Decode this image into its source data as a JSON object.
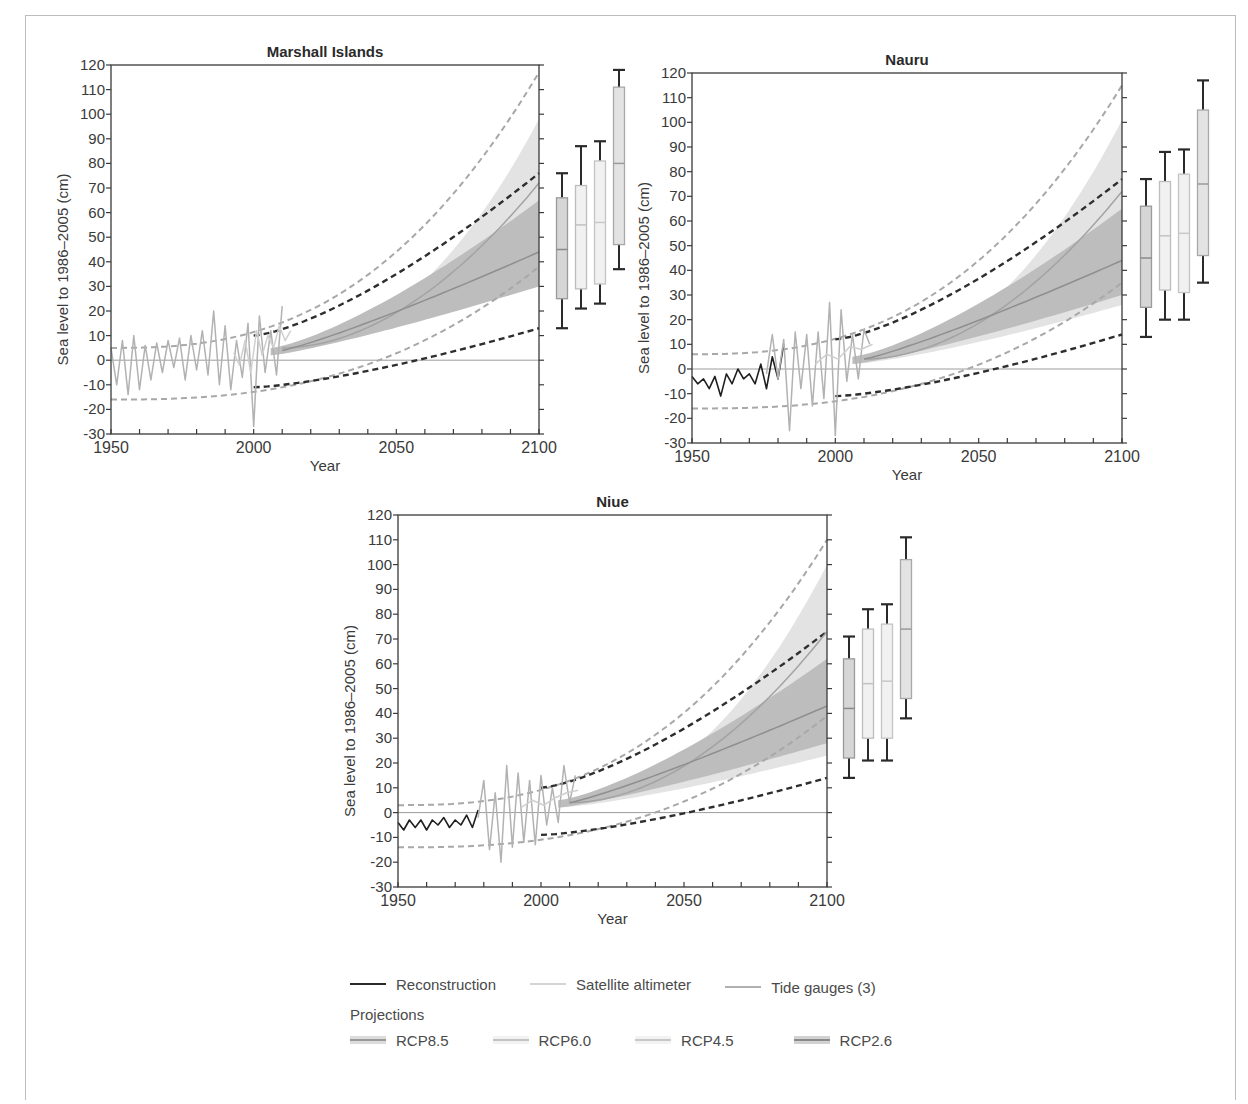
{
  "figure": {
    "frame": true
  },
  "axes_common": {
    "ylabel": "Sea level to 1986–2005 (cm)",
    "xlabel": "Year",
    "yticks": [
      120,
      110,
      100,
      90,
      80,
      70,
      60,
      50,
      40,
      30,
      20,
      10,
      0,
      -10,
      -20,
      -30
    ],
    "xticks": [
      1950,
      2000,
      2050,
      2100
    ],
    "ylim": [
      -30,
      120
    ],
    "xlim": [
      1950,
      2100
    ]
  },
  "legend": {
    "observations": [
      {
        "label": "Reconstruction",
        "color": "#2a2a2a"
      },
      {
        "label": "Satellite altimeter",
        "color": "#d4d4d4"
      },
      {
        "label": "Tide gauges (3)",
        "color": "#b0b0b0"
      }
    ],
    "projections_title": "Projections",
    "projections": [
      {
        "label": "RCP8.5",
        "band": "#d9d9d9",
        "line": "#9a9a9a"
      },
      {
        "label": "RCP6.0",
        "band": "#ececec",
        "line": "#c4c4c4"
      },
      {
        "label": "RCP4.5",
        "band": "#eeeeee",
        "line": "#c8c8c8"
      },
      {
        "label": "RCP2.6",
        "band": "#cfcfcf",
        "line": "#8a8a8a"
      }
    ]
  },
  "chart_data": [
    {
      "type": "line",
      "title": "Marshall Islands",
      "xlabel": "Year",
      "ylabel": "Sea level to 1986–2005 (cm)",
      "xlim": [
        1950,
        2100
      ],
      "ylim": [
        -30,
        120
      ],
      "grid": false,
      "series": [
        {
          "name": "Tide gauges (3)",
          "x": [
            1950,
            1952,
            1954,
            1956,
            1958,
            1960,
            1962,
            1964,
            1966,
            1968,
            1970,
            1972,
            1974,
            1976,
            1978,
            1980,
            1982,
            1984,
            1986,
            1988,
            1990,
            1992,
            1994,
            1996,
            1998,
            2000,
            2002,
            2004,
            2006,
            2008,
            2010
          ],
          "values": [
            5,
            -10,
            8,
            -14,
            10,
            -12,
            6,
            -8,
            7,
            -5,
            8,
            -3,
            9,
            -8,
            10,
            -4,
            12,
            -6,
            20,
            -10,
            14,
            -12,
            8,
            -7,
            15,
            -27,
            18,
            -5,
            12,
            -6,
            22
          ]
        },
        {
          "name": "Satellite altimeter",
          "x": [
            1993,
            1995,
            1997,
            1999,
            2001,
            2003,
            2005,
            2007,
            2009,
            2011,
            2013
          ],
          "values": [
            3,
            -2,
            8,
            -5,
            12,
            2,
            10,
            5,
            14,
            8,
            12
          ]
        },
        {
          "name": "RCP8.5 median",
          "x": [
            2010,
            2100
          ],
          "values": [
            5,
            72
          ]
        },
        {
          "name": "RCP2.6 median",
          "x": [
            2010,
            2100
          ],
          "values": [
            4,
            44
          ]
        }
      ],
      "envelopes": {
        "rcp85_band": {
          "x_end": 2100,
          "upper": 98,
          "lower": 36
        },
        "rcp26_band": {
          "x_end": 2100,
          "upper": 65,
          "lower": 30
        },
        "upper_grey_dashed": {
          "start": [
            1950,
            5
          ],
          "end": [
            2100,
            117
          ]
        },
        "lower_grey_dashed": {
          "start": [
            1950,
            -16
          ],
          "end": [
            2100,
            38
          ]
        },
        "upper_black_dashed": {
          "start": [
            2000,
            10
          ],
          "end": [
            2100,
            76
          ]
        },
        "lower_black_dashed": {
          "start": [
            2000,
            -11
          ],
          "end": [
            2100,
            13
          ]
        }
      },
      "boxplots_2100": [
        {
          "scenario": "RCP2.6",
          "min": 13,
          "q1": 25,
          "median": 45,
          "q3": 66,
          "max": 76
        },
        {
          "scenario": "RCP4.5",
          "min": 21,
          "q1": 29,
          "median": 55,
          "q3": 71,
          "max": 87
        },
        {
          "scenario": "RCP6.0",
          "min": 23,
          "q1": 31,
          "median": 56,
          "q3": 81,
          "max": 89
        },
        {
          "scenario": "RCP8.5",
          "min": 37,
          "q1": 47,
          "median": 80,
          "q3": 111,
          "max": 118
        }
      ]
    },
    {
      "type": "line",
      "title": "Nauru",
      "xlabel": "Year",
      "ylabel": "Sea level to 1986–2005 (cm)",
      "xlim": [
        1950,
        2100
      ],
      "ylim": [
        -30,
        120
      ],
      "grid": false,
      "series": [
        {
          "name": "Reconstruction",
          "x": [
            1950,
            1952,
            1954,
            1956,
            1958,
            1960,
            1962,
            1964,
            1966,
            1968,
            1970,
            1972,
            1974,
            1976,
            1978,
            1980,
            1982
          ],
          "values": [
            -3,
            -6,
            -4,
            -8,
            -3,
            -11,
            -2,
            -6,
            0,
            -4,
            -2,
            -6,
            2,
            -8,
            5,
            -4,
            10
          ]
        },
        {
          "name": "Tide gauges (3)",
          "x": [
            1976,
            1978,
            1980,
            1982,
            1984,
            1986,
            1988,
            1990,
            1992,
            1994,
            1996,
            1998,
            2000,
            2002,
            2004,
            2006,
            2008,
            2010,
            2012
          ],
          "values": [
            -2,
            14,
            -4,
            12,
            -25,
            15,
            -8,
            14,
            -15,
            15,
            -12,
            27,
            -27,
            24,
            -5,
            14,
            -4,
            16,
            10
          ]
        },
        {
          "name": "Satellite altimeter",
          "x": [
            1993,
            1997,
            2001,
            2005,
            2009,
            2013
          ],
          "values": [
            2,
            6,
            4,
            9,
            8,
            10
          ]
        },
        {
          "name": "RCP8.5 median",
          "x": [
            2010,
            2100
          ],
          "values": [
            4,
            72
          ]
        },
        {
          "name": "RCP2.6 median",
          "x": [
            2010,
            2100
          ],
          "values": [
            4,
            44
          ]
        }
      ],
      "envelopes": {
        "rcp85_band": {
          "x_end": 2100,
          "upper": 101,
          "lower": 26
        },
        "rcp26_band": {
          "x_end": 2100,
          "upper": 65,
          "lower": 30
        },
        "upper_grey_dashed": {
          "start": [
            1950,
            6
          ],
          "end": [
            2100,
            115
          ]
        },
        "lower_grey_dashed": {
          "start": [
            1950,
            -16
          ],
          "end": [
            2100,
            35
          ]
        },
        "upper_black_dashed": {
          "start": [
            2000,
            12
          ],
          "end": [
            2100,
            77
          ]
        },
        "lower_black_dashed": {
          "start": [
            2000,
            -11
          ],
          "end": [
            2100,
            14
          ]
        }
      },
      "boxplots_2100": [
        {
          "scenario": "RCP2.6",
          "min": 13,
          "q1": 25,
          "median": 45,
          "q3": 66,
          "max": 77
        },
        {
          "scenario": "RCP4.5",
          "min": 20,
          "q1": 32,
          "median": 54,
          "q3": 76,
          "max": 88
        },
        {
          "scenario": "RCP6.0",
          "min": 20,
          "q1": 31,
          "median": 55,
          "q3": 79,
          "max": 89
        },
        {
          "scenario": "RCP8.5",
          "min": 35,
          "q1": 46,
          "median": 75,
          "q3": 105,
          "max": 117
        }
      ]
    },
    {
      "type": "line",
      "title": "Niue",
      "xlabel": "Year",
      "ylabel": "Sea level to 1986–2005 (cm)",
      "xlim": [
        1950,
        2100
      ],
      "ylim": [
        -30,
        120
      ],
      "grid": false,
      "series": [
        {
          "name": "Reconstruction",
          "x": [
            1950,
            1952,
            1954,
            1956,
            1958,
            1960,
            1962,
            1964,
            1966,
            1968,
            1970,
            1972,
            1974,
            1976,
            1978
          ],
          "values": [
            -4,
            -7,
            -3,
            -6,
            -3,
            -7,
            -3,
            -5,
            -2,
            -6,
            -3,
            -5,
            -1,
            -6,
            1
          ]
        },
        {
          "name": "Tide gauges (3)",
          "x": [
            1978,
            1980,
            1982,
            1984,
            1986,
            1988,
            1990,
            1992,
            1994,
            1996,
            1998,
            2000,
            2002,
            2004,
            2006,
            2008,
            2010,
            2012
          ],
          "values": [
            -2,
            13,
            -15,
            8,
            -20,
            19,
            -14,
            16,
            -12,
            13,
            -13,
            15,
            -5,
            10,
            -4,
            19,
            4,
            15
          ]
        },
        {
          "name": "Satellite altimeter",
          "x": [
            1993,
            1997,
            2001,
            2005,
            2009,
            2013
          ],
          "values": [
            2,
            5,
            3,
            6,
            8,
            9
          ]
        },
        {
          "name": "RCP8.5 median",
          "x": [
            2010,
            2100
          ],
          "values": [
            4,
            73
          ]
        },
        {
          "name": "RCP2.6 median",
          "x": [
            2010,
            2100
          ],
          "values": [
            4,
            43
          ]
        }
      ],
      "envelopes": {
        "rcp85_band": {
          "x_end": 2100,
          "upper": 100,
          "lower": 23
        },
        "rcp26_band": {
          "x_end": 2100,
          "upper": 62,
          "lower": 28
        },
        "upper_grey_dashed": {
          "start": [
            1950,
            3
          ],
          "end": [
            2100,
            110
          ]
        },
        "lower_grey_dashed": {
          "start": [
            1950,
            -14
          ],
          "end": [
            2100,
            39
          ]
        },
        "upper_black_dashed": {
          "start": [
            2000,
            10
          ],
          "end": [
            2100,
            73
          ]
        },
        "lower_black_dashed": {
          "start": [
            2000,
            -9
          ],
          "end": [
            2100,
            14
          ]
        }
      },
      "boxplots_2100": [
        {
          "scenario": "RCP2.6",
          "min": 14,
          "q1": 22,
          "median": 42,
          "q3": 62,
          "max": 71
        },
        {
          "scenario": "RCP4.5",
          "min": 21,
          "q1": 30,
          "median": 52,
          "q3": 74,
          "max": 82
        },
        {
          "scenario": "RCP6.0",
          "min": 21,
          "q1": 30,
          "median": 53,
          "q3": 76,
          "max": 84
        },
        {
          "scenario": "RCP8.5",
          "min": 38,
          "q1": 46,
          "median": 74,
          "q3": 102,
          "max": 111
        }
      ]
    }
  ]
}
